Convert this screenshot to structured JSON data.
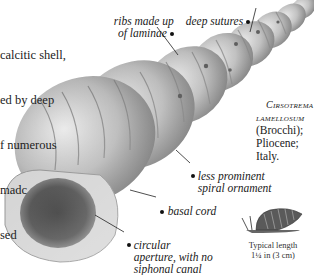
{
  "intro_text": {
    "lines": [
      "calcitic shell,",
      "ed by deep",
      "f numerous",
      "madc",
      "sed"
    ]
  },
  "annotations": [
    {
      "id": "ribs",
      "text": "ribs made up\nof laminae"
    },
    {
      "id": "sutures",
      "text": "deep sutures"
    },
    {
      "id": "spiral",
      "text": "less prominent\nspiral ornament"
    },
    {
      "id": "basal",
      "text": "basal cord"
    },
    {
      "id": "aperture",
      "text": "circular\naperture, with no\nsiphonal canal"
    }
  ],
  "species": {
    "genus": "Cirsotrema",
    "epithet": "lamellosum",
    "authority_age": "(Brocchi); Pliocene;",
    "locality": "Italy."
  },
  "size_caption": {
    "line1": "Typical length",
    "line2": "1¼ in (3 cm)"
  },
  "colors": {
    "shell_light": "#d8d8d8",
    "shell_mid": "#9a9a9a",
    "shell_dark": "#3a3a3a",
    "aperture": "#151515"
  }
}
